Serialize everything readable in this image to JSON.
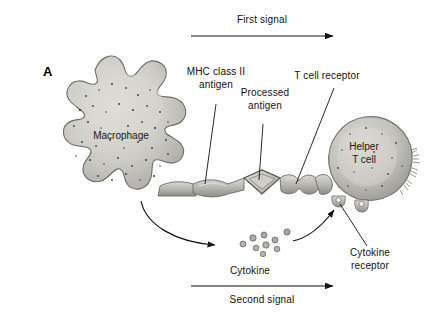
{
  "figure": {
    "panel_letter": "A",
    "background_color": "#ffffff",
    "cell_fill_color": "#c9c6c0",
    "line_color": "#15110f"
  },
  "signals": {
    "first": "First signal",
    "second": "Second signal"
  },
  "labels": {
    "mhc_line1": "MHC class II",
    "mhc_line2": "antigen",
    "processed_line1": "Processed",
    "processed_line2": "antigen",
    "tcr": "T cell receptor",
    "cytokine": "Cytokine",
    "cytokine_receptor_line1": "Cytokine",
    "cytokine_receptor_line2": "receptor"
  },
  "cells": {
    "macrophage": "Macrophage",
    "helper_t_line1": "Helper",
    "helper_t_line2": "T cell"
  }
}
